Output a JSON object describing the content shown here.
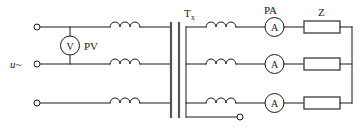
{
  "figure": {
    "background": "#ffffff",
    "line_color": "#1a1a1a",
    "bus_color": "#555555"
  },
  "labels": {
    "source": "u~",
    "voltmeter_tag": "PV",
    "voltmeter_symbol": "V",
    "transformer_main": "T",
    "transformer_sub": "x",
    "ammeter_tag": "PA",
    "ammeter_symbol": "A",
    "load": "Z"
  },
  "components": {
    "voltmeter": {
      "symbol": "V",
      "tag": "PV"
    },
    "ammeters": [
      {
        "symbol": "A",
        "tag": "PA"
      },
      {
        "symbol": "A",
        "tag": ""
      },
      {
        "symbol": "A",
        "tag": ""
      }
    ],
    "loads": [
      {
        "label": "Z"
      },
      {
        "label": ""
      },
      {
        "label": ""
      }
    ],
    "primary_coils": 3,
    "secondary_coils": 3,
    "input_terminals": 3,
    "neutral_terminals": 1
  }
}
